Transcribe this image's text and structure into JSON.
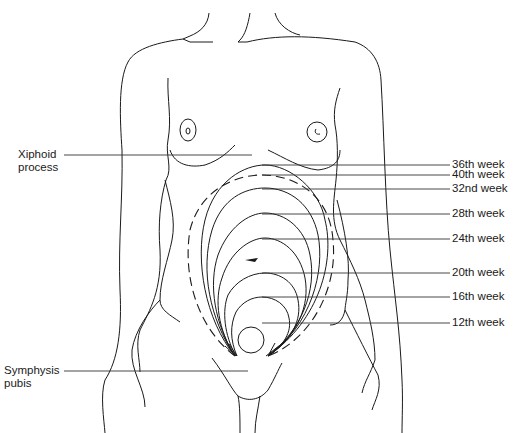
{
  "left_labels": [
    {
      "id": "xiphoid",
      "line1": "Xiphoid",
      "line2": "process"
    },
    {
      "id": "symphysis",
      "line1": "Symphysis",
      "line2": "pubis"
    }
  ],
  "week_labels": [
    {
      "text": "36th week"
    },
    {
      "text": "40th week"
    },
    {
      "text": "32nd week"
    },
    {
      "text": "28th week"
    },
    {
      "text": "24th week"
    },
    {
      "text": "20th week"
    },
    {
      "text": "16th week"
    },
    {
      "text": "12th week"
    }
  ],
  "colors": {
    "line": "#1a1a1a",
    "background": "#ffffff"
  }
}
